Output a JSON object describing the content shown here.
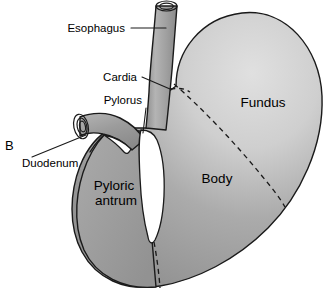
{
  "figure": {
    "panel_label": "B",
    "background_color": "#ffffff",
    "outline_color": "#1a1a1a",
    "organ_fill_color": "#9e9e9e",
    "organ_highlight_color": "#dcdcdc",
    "lumen_color": "#ffffff",
    "dashed_divider_color": "#1a1a1a"
  },
  "callout_labels": [
    {
      "id": "esophagus",
      "text": "Esophagus",
      "text_x": 125,
      "text_y": 32,
      "anchor": "end",
      "leader": "M 131 28 L 166 28"
    },
    {
      "id": "cardia",
      "text": "Cardia",
      "text_x": 137,
      "text_y": 81,
      "anchor": "end",
      "leader": "M 142 77 L 170 89"
    },
    {
      "id": "pylorus",
      "text": "Pylorus",
      "text_x": 142,
      "text_y": 104,
      "anchor": "end",
      "leader": "M 146 108 L 143 133"
    },
    {
      "id": "duodenum",
      "text": "Duodenum",
      "text_x": 22,
      "text_y": 167,
      "anchor": "start",
      "leader": "M 32 157 L 86 135"
    }
  ],
  "region_labels": [
    {
      "id": "fundus",
      "text": "Fundus",
      "x": 263,
      "y": 107,
      "lines": [
        "Fundus"
      ]
    },
    {
      "id": "body",
      "text": "Body",
      "x": 217,
      "y": 183,
      "lines": [
        "Body"
      ]
    },
    {
      "id": "pyloric-antrum",
      "text": "Pyloric antrum",
      "x": 116,
      "y": 190,
      "lines": [
        "Pyloric",
        "antrum"
      ]
    }
  ],
  "structures": [
    {
      "id": "esophagus-tube",
      "name": "Esophagus"
    },
    {
      "id": "esophagus-lumen-opening",
      "name": "Esophageal lumen"
    },
    {
      "id": "fundus-region",
      "name": "Fundus"
    },
    {
      "id": "body-region",
      "name": "Body"
    },
    {
      "id": "pyloric-antrum-region",
      "name": "Pyloric antrum"
    },
    {
      "id": "pylorus-junction",
      "name": "Pylorus"
    },
    {
      "id": "duodenum-tube",
      "name": "Duodenum"
    },
    {
      "id": "duodenum-lumen-opening",
      "name": "Duodenal lumen"
    },
    {
      "id": "gastric-lumen-channel",
      "name": "Gastric lumen"
    },
    {
      "id": "cardia-divider",
      "name": "Cardia boundary"
    },
    {
      "id": "fundus-body-divider",
      "name": "Fundus–body boundary"
    },
    {
      "id": "antrum-body-divider",
      "name": "Antrum–body boundary"
    }
  ]
}
